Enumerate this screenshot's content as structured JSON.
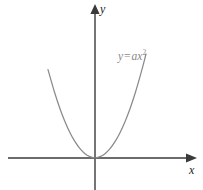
{
  "figure": {
    "background_color": "#ffffff",
    "axis_color": "#3a3a3a",
    "curve_color": "#8a8a8a",
    "label_color": "#1b1b1b",
    "equation_color": "#8a8a8a",
    "y_axis_label": "y",
    "x_axis_label": "x",
    "equation": {
      "lhs": "y",
      "operator": "=",
      "coefficient": "a",
      "variable": "x",
      "exponent": "2",
      "full_text": "y = ax²"
    }
  },
  "chart_data": {
    "type": "line",
    "title": "",
    "subtitle": "",
    "xlabel": "x",
    "ylabel": "y",
    "legend": [],
    "legend_position": "none",
    "grid": false,
    "annotations": [
      {
        "text": "y = ax²",
        "x": 0.62,
        "y": 1.0,
        "color": "#8a8a8a",
        "role": "curve-equation"
      }
    ],
    "axes": {
      "x_axis": {
        "visible": true,
        "arrow": "right",
        "tick_labels": [],
        "range": [
          -0.95,
          1.07
        ],
        "origin_px": [
          95,
          158
        ]
      },
      "y_axis": {
        "visible": true,
        "arrow": "up",
        "tick_labels": [],
        "range": [
          -0.33,
          1.63
        ],
        "origin_px": [
          95,
          158
        ]
      }
    },
    "series": [
      {
        "name": "y = ax²",
        "color": "#8a8a8a",
        "equation": "y = a*x^2",
        "coefficient_a": 1.0,
        "vertex": [
          0,
          0
        ],
        "opens": "up",
        "x": [
          -0.94,
          -0.85,
          -0.75,
          -0.65,
          -0.55,
          -0.45,
          -0.35,
          -0.25,
          -0.15,
          -0.05,
          0,
          0.05,
          0.15,
          0.25,
          0.35,
          0.45,
          0.55,
          0.65,
          0.75,
          0.85,
          0.95,
          1.02
        ],
        "values": [
          0.884,
          0.723,
          0.563,
          0.423,
          0.303,
          0.203,
          0.123,
          0.063,
          0.023,
          0.003,
          0,
          0.003,
          0.023,
          0.063,
          0.123,
          0.203,
          0.303,
          0.423,
          0.563,
          0.723,
          0.903,
          1.04
        ]
      }
    ]
  }
}
